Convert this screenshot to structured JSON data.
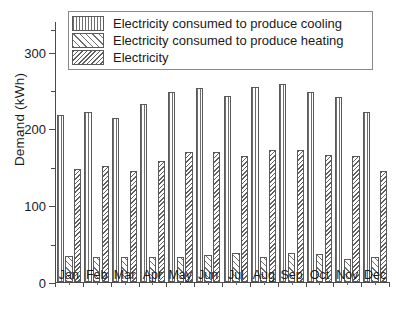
{
  "chart_data": {
    "type": "bar",
    "title": "",
    "xlabel": "",
    "ylabel": "Demand (kWh)",
    "ylim": [
      0,
      340
    ],
    "yticks": [
      0,
      100,
      200,
      300
    ],
    "ytick_labels": [
      "0",
      "100",
      "200",
      "300"
    ],
    "yminor_ticks": [
      50,
      150,
      250,
      330
    ],
    "grid": false,
    "legend_position": "top",
    "categories": [
      "Jan",
      "Feb",
      "Mar",
      "Apr",
      "May",
      "Jun",
      "Jul",
      "Aug",
      "Sep",
      "Oct",
      "Nov",
      "Dec"
    ],
    "series": [
      {
        "name": "Electricity consumed to produce cooling",
        "pattern": "vertical-lines",
        "values": [
          218,
          222,
          214,
          232,
          248,
          253,
          242,
          254,
          258,
          248,
          241,
          221
        ]
      },
      {
        "name": "Electricity consumed to produce heating",
        "pattern": "diagonal-hatch",
        "values": [
          34,
          33,
          33,
          33,
          32,
          35,
          38,
          32,
          38,
          36,
          30,
          32
        ]
      },
      {
        "name": "Electricity",
        "pattern": "dense-crosshatch",
        "values": [
          147,
          151,
          144,
          158,
          170,
          170,
          164,
          172,
          172,
          165,
          164,
          145
        ]
      }
    ]
  },
  "legend": {
    "items": [
      {
        "label": "Electricity consumed to produce cooling"
      },
      {
        "label": "Electricity consumed to produce heating"
      },
      {
        "label": "Electricity"
      }
    ]
  }
}
